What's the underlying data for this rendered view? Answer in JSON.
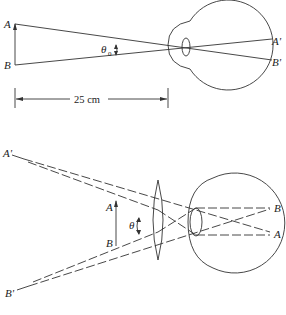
{
  "top_diagram": {
    "title": "Unaided eye viewing object at near point",
    "labels": {
      "object_top": "A",
      "object_bottom": "B",
      "image_top": "A'",
      "image_bottom": "B'",
      "angle": "θ",
      "angle_subscript": "0",
      "distance": "25 cm"
    }
  },
  "bottom_diagram": {
    "title": "Eye viewing object through magnifying lens",
    "labels": {
      "virtual_image_top": "A'",
      "virtual_image_bottom": "B'",
      "object_top": "A",
      "object_bottom": "B",
      "angle": "θ",
      "retina_top": "B",
      "retina_bottom": "A"
    }
  },
  "colors": {
    "line": "#333333",
    "background": "#ffffff"
  }
}
